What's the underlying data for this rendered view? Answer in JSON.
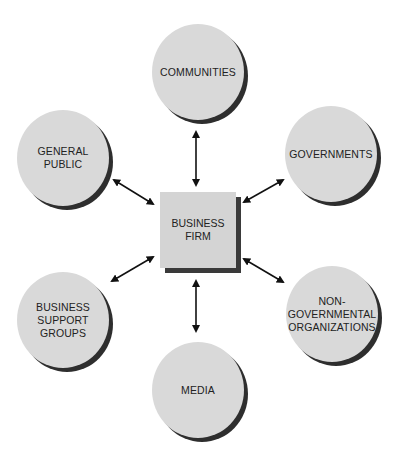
{
  "diagram": {
    "center": {
      "label_line1": "BUSINESS",
      "label_line2": "FIRM"
    },
    "stakeholders": [
      {
        "id": "communities",
        "lines": [
          "COMMUNITIES"
        ]
      },
      {
        "id": "general-public",
        "lines": [
          "GENERAL",
          "PUBLIC"
        ]
      },
      {
        "id": "governments",
        "lines": [
          "GOVERNMENTS"
        ]
      },
      {
        "id": "business-support-groups",
        "lines": [
          "BUSINESS",
          "SUPPORT",
          "GROUPS"
        ]
      },
      {
        "id": "non-governmental-organizations",
        "lines": [
          "NON-",
          "GOVERNMENTAL",
          "ORGANIZATIONS"
        ]
      },
      {
        "id": "media",
        "lines": [
          "MEDIA"
        ]
      }
    ],
    "colors": {
      "fill": "#d9d9d9",
      "shadow": "#2e2e2e",
      "arrow": "#111111"
    }
  }
}
